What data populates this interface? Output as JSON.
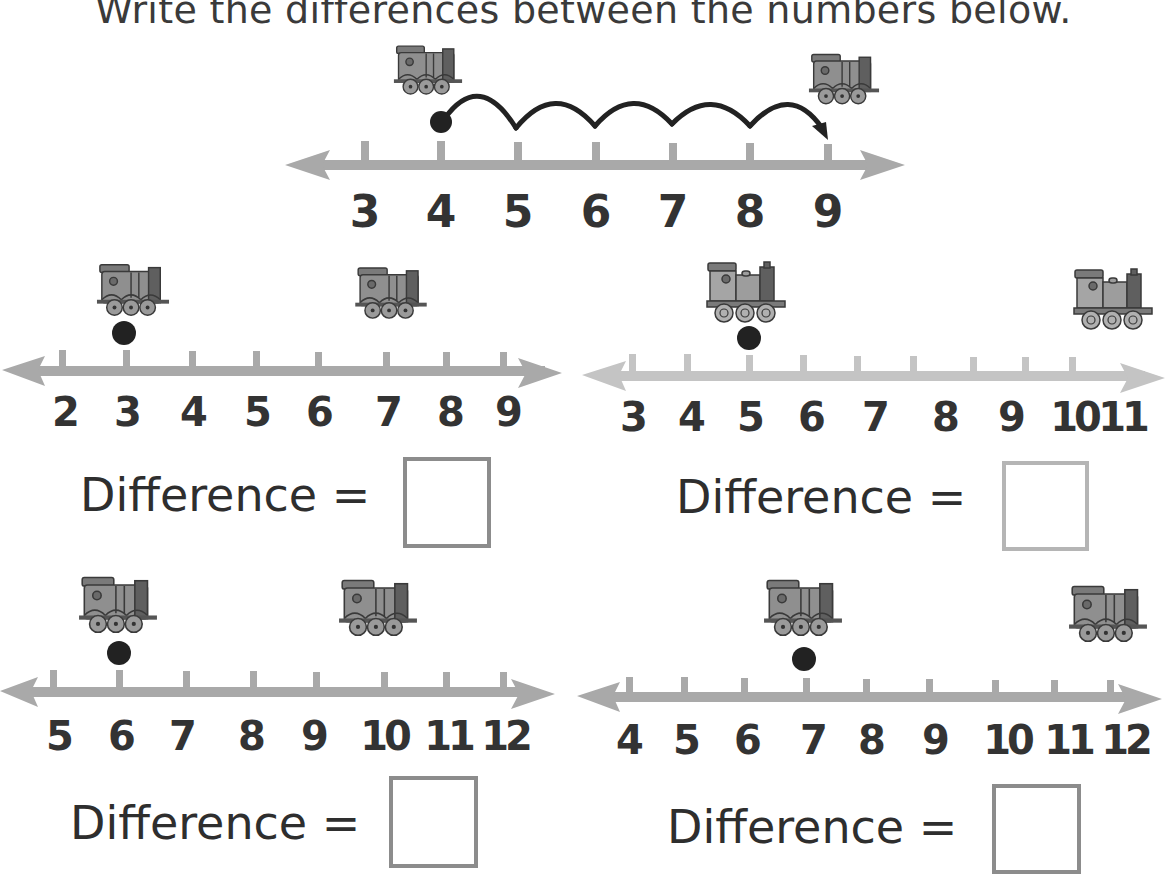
{
  "title": "Write the differences between the numbers below.",
  "colors": {
    "number_line": "#a9a9a9",
    "number_line_light": "#c4c4c4",
    "text": "#333333",
    "dot": "#222222",
    "box_border": "#8c8c8c",
    "box_border_light": "#b5b5b5",
    "train_body": "#8a8a8a",
    "train_dark": "#5e5e5e"
  },
  "example": {
    "labels": [
      "3",
      "4",
      "5",
      "6",
      "7",
      "8",
      "9"
    ],
    "start": "4",
    "end": "9",
    "jumps": 5
  },
  "problems": [
    {
      "id": "a",
      "labels": [
        "2",
        "3",
        "4",
        "5",
        "6",
        "7",
        "8",
        "9"
      ],
      "start": "3",
      "end": "7",
      "difference_label": "Difference =",
      "answer": ""
    },
    {
      "id": "b",
      "labels": [
        "3",
        "4",
        "5",
        "6",
        "7",
        "8",
        "9",
        "10",
        "11"
      ],
      "start": "5",
      "end": "11",
      "difference_label": "Difference =",
      "answer": ""
    },
    {
      "id": "c",
      "labels": [
        "5",
        "6",
        "7",
        "8",
        "9",
        "10",
        "11",
        "12"
      ],
      "start": "6",
      "end": "10",
      "difference_label": "Difference =",
      "answer": ""
    },
    {
      "id": "d",
      "labels": [
        "4",
        "5",
        "6",
        "7",
        "8",
        "9",
        "10",
        "11",
        "12"
      ],
      "start": "7",
      "end": "12",
      "difference_label": "Difference =",
      "answer": ""
    }
  ],
  "icons": {
    "start_marker": "train-engine-icon",
    "end_marker": "train-engine-icon",
    "position_marker": "dot-icon"
  }
}
